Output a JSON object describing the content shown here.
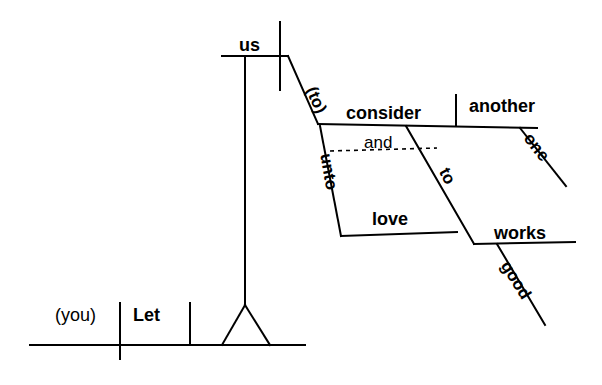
{
  "diagram": {
    "type": "reed-kellogg-sentence-diagram",
    "sentence": "Let us consider one another unto love and good works",
    "ink_color": "#000000",
    "background_color": "#ffffff",
    "words": {
      "subject": "(you)",
      "verb": "Let",
      "object_us": "us",
      "infinitive_marker": "(to)",
      "infinitive_verb": "consider",
      "direct_object": "another",
      "modifier_one": "one",
      "preposition_unto": "unto",
      "prep_object_love": "love",
      "conjunction_and": "and",
      "preposition_to": "to",
      "prep_object_works": "works",
      "modifier_good": "good"
    }
  }
}
